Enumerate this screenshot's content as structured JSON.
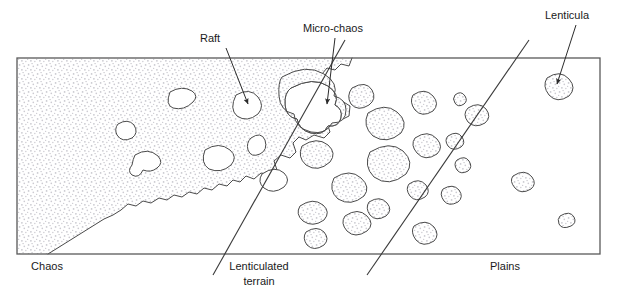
{
  "figure": {
    "type": "geologic-cross-section-map",
    "background_color": "#ffffff",
    "line_color": "#3a3a3a",
    "stipple_color": "#c9c9cf",
    "text_color": "#1a1a1a"
  },
  "callouts": [
    {
      "id": "raft",
      "label": "Raft",
      "text_x": 200,
      "text_y": 42,
      "anchor": "start",
      "arrow_from_x": 226,
      "arrow_from_y": 48,
      "arrow_to_x": 248,
      "arrow_to_y": 104
    },
    {
      "id": "micro-chaos",
      "label": "Micro-chaos",
      "text_x": 303,
      "text_y": 32,
      "anchor": "start",
      "arrow_from_x": 335,
      "arrow_from_y": 38,
      "arrow_to_x": 327,
      "arrow_to_y": 104
    },
    {
      "id": "lenticula",
      "label": "Lenticula",
      "text_x": 545,
      "text_y": 19,
      "anchor": "start",
      "arrow_from_x": 576,
      "arrow_from_y": 25,
      "arrow_to_x": 557,
      "arrow_to_y": 84
    }
  ],
  "zone_labels": [
    {
      "id": "chaos",
      "line1": "Chaos",
      "line2": "",
      "x": 47,
      "y": 270
    },
    {
      "id": "lenticulated-terrain",
      "line1": "Lenticulated",
      "line2": "terrain",
      "x": 259,
      "y": 270
    },
    {
      "id": "plains",
      "line1": "Plains",
      "line2": "",
      "x": 505,
      "y": 270
    }
  ],
  "frame": {
    "left": 17,
    "top": 58,
    "right": 600,
    "bottom": 254
  },
  "divider_lines": [
    {
      "id": "chaos-lenticulated-divider",
      "x1": 345,
      "y1": 40,
      "x2": 213,
      "y2": 275
    },
    {
      "id": "lenticulated-plains-divider",
      "x1": 529,
      "y1": 40,
      "x2": 367,
      "y2": 275
    }
  ],
  "chart_data": {
    "type": "map",
    "zones": [
      {
        "name": "Chaos",
        "stipple": "continuous-matrix",
        "feature_density": "high",
        "features": "white rafts embedded in stippled matrix"
      },
      {
        "name": "Lenticulated terrain",
        "stipple": "isolated-patches",
        "feature_density": "medium",
        "features": "stippled lenticulae and micro-chaos patches"
      },
      {
        "name": "Plains",
        "stipple": "sparse-patches",
        "feature_density": "low",
        "features": "few small lenticulae"
      }
    ]
  }
}
